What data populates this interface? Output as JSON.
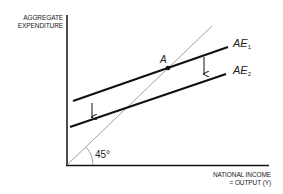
{
  "diagram": {
    "type": "keynesian-cross",
    "y_axis_label_line1": "AGGREGATE",
    "y_axis_label_line2": "EXPENDITURE",
    "x_axis_label_line1": "NATIONAL INCOME",
    "x_axis_label_line2": "= OUTPUT (Y)",
    "curves": [
      {
        "name": "AE",
        "subscript": "1"
      },
      {
        "name": "AE",
        "subscript": "2"
      }
    ],
    "point_label": "A",
    "angle_label": "45°",
    "colors": {
      "line": "#111111",
      "guide": "#777777",
      "text": "#222222"
    }
  }
}
